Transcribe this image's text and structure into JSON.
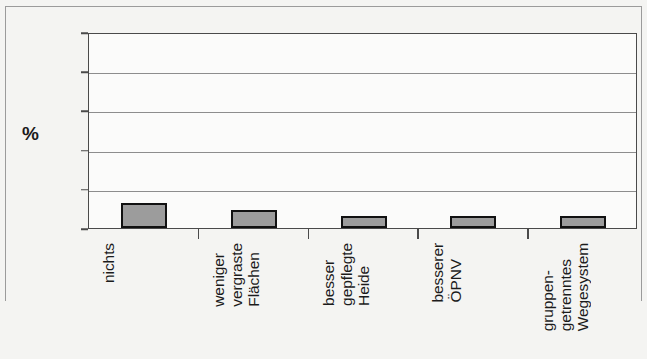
{
  "chart_data": {
    "type": "bar",
    "title": "",
    "subtitle": "",
    "xlabel": "",
    "ylabel": "%",
    "ylim": [
      0,
      100
    ],
    "yticks": [
      0,
      20,
      40,
      60,
      80,
      100
    ],
    "ytick_labels": [
      "0",
      "20",
      "40",
      "60",
      "80",
      "100"
    ],
    "grid": true,
    "grid_axis": "y",
    "legend": false,
    "legend_position": "none",
    "categories": [
      "nichts",
      "weniger vergraste Flächen",
      "besser gepflegte Heide",
      "besserer ÖPNV",
      "gruppen-getrenntes Wegesystem"
    ],
    "category_lines": [
      [
        "nichts"
      ],
      [
        "weniger",
        "vergraste",
        "Flächen"
      ],
      [
        "besser",
        "gepflegte",
        "Heide"
      ],
      [
        "besserer",
        "ÖPNV"
      ],
      [
        "gruppen-",
        "getrenntes",
        "Wegesystem"
      ]
    ],
    "values": [
      13,
      9,
      6,
      6,
      6
    ],
    "bar_color": "#9c9c9c",
    "bar_edge_color": "#111111",
    "plot_background": "#fbfbfa",
    "figure_background": "#f4f4f2",
    "axis_color": "#4a4a4a",
    "gridline_color": "#8d8d8d",
    "text_color": "#1b1b1b"
  }
}
